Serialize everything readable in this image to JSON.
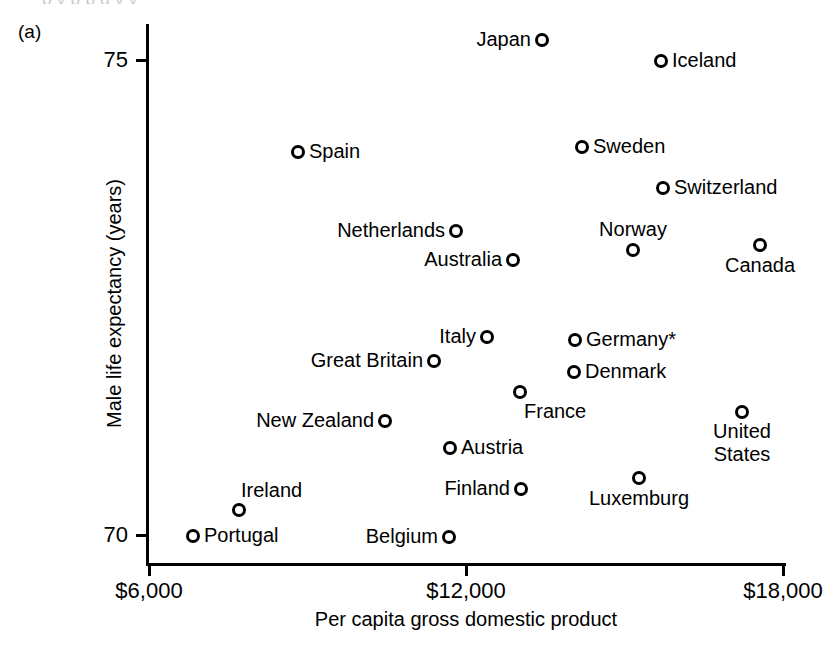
{
  "figure": {
    "panel_letter": "(a)",
    "top_bleed_text": "p        y   p    p          g y      y"
  },
  "chart_data": {
    "type": "scatter",
    "title": "",
    "xlabel": "Per capita gross domestic product",
    "ylabel": "Male life expectancy (years)",
    "xlim": [
      4700,
      18800
    ],
    "ylim": [
      69.3,
      75.6
    ],
    "xticks": [
      "$6,000",
      "$12,000",
      "$18,000"
    ],
    "xtick_values": [
      6000,
      12000,
      18000
    ],
    "yticks": [
      "75",
      "70"
    ],
    "ytick_values": [
      75,
      70
    ],
    "grid": false,
    "legend": "none",
    "annotations": [
      "* Germany"
    ],
    "points": [
      {
        "label": "Japan",
        "x": 13440,
        "y": 76.05,
        "px": 542,
        "py": 40,
        "place": "left"
      },
      {
        "label": "Iceland",
        "x": 15690,
        "y": 74.95,
        "px": 661,
        "py": 61,
        "place": "right"
      },
      {
        "label": "Spain",
        "x": 8820,
        "y": 74.15,
        "px": 298,
        "py": 152,
        "place": "right"
      },
      {
        "label": "Sweden",
        "x": 14200,
        "y": 74.4,
        "px": 582,
        "py": 147,
        "place": "right"
      },
      {
        "label": "Switzerland",
        "x": 15730,
        "y": 73.25,
        "px": 663,
        "py": 188,
        "place": "right"
      },
      {
        "label": "Netherlands",
        "x": 11810,
        "y": 73.0,
        "px": 456,
        "py": 231,
        "place": "left"
      },
      {
        "label": "Norway",
        "x": 15160,
        "y": 73.0,
        "px": 633,
        "py": 250,
        "place": "above"
      },
      {
        "label": "Canada",
        "x": 17580,
        "y": 73.25,
        "px": 760,
        "py": 245,
        "place": "below"
      },
      {
        "label": "Australia",
        "x": 12890,
        "y": 72.45,
        "px": 513,
        "py": 260,
        "place": "left"
      },
      {
        "label": "Italy",
        "x": 12400,
        "y": 72.4,
        "px": 487,
        "py": 337,
        "place": "left"
      },
      {
        "label": "Germany*",
        "x": 14070,
        "y": 72.25,
        "px": 575,
        "py": 340,
        "place": "right"
      },
      {
        "label": "Great Britain",
        "x": 11400,
        "y": 71.15,
        "px": 434,
        "py": 361,
        "place": "left"
      },
      {
        "label": "Denmark",
        "x": 14050,
        "y": 71.6,
        "px": 574,
        "py": 372,
        "place": "right"
      },
      {
        "label": "France",
        "x": 13020,
        "y": 71.5,
        "px": 520,
        "py": 392,
        "place": "belowright"
      },
      {
        "label": "New Zealand",
        "x": 10470,
        "y": 71.0,
        "px": 385,
        "py": 421,
        "place": "left"
      },
      {
        "label": "United\nStates",
        "x": 17230,
        "y": 71.45,
        "px": 742,
        "py": 412,
        "place": "below2"
      },
      {
        "label": "Austria",
        "x": 11700,
        "y": 70.6,
        "px": 450,
        "py": 448,
        "place": "right"
      },
      {
        "label": "Luxemburg",
        "x": 15280,
        "y": 70.2,
        "px": 639,
        "py": 478,
        "place": "below"
      },
      {
        "label": "Finland",
        "x": 13040,
        "y": 70.4,
        "px": 521,
        "py": 489,
        "place": "left"
      },
      {
        "label": "Ireland",
        "x": 7700,
        "y": 70.35,
        "px": 239,
        "py": 510,
        "place": "aboveright"
      },
      {
        "label": "Portugal",
        "x": 6830,
        "y": 69.98,
        "px": 193,
        "py": 536,
        "place": "right"
      },
      {
        "label": "Belgium",
        "x": 11660,
        "y": 69.95,
        "px": 449,
        "py": 537,
        "place": "left"
      }
    ]
  }
}
